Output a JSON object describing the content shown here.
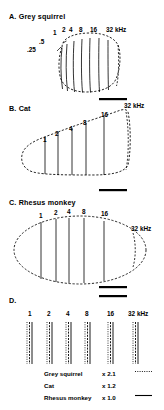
{
  "figure": {
    "caption_panels": [
      "A",
      "B",
      "C",
      "D"
    ],
    "unit": "kHz"
  },
  "panels": {
    "a": {
      "label": "A. Grey squirrel",
      "title_letter": "A.",
      "species": "Grey squirrel",
      "freq_labels": [
        ".25",
        ".5",
        "1",
        "2",
        "4",
        "8",
        "16"
      ],
      "top_label": "32 kHz",
      "shape": "rounded-oval",
      "isofrequency_contour_count": 8
    },
    "b": {
      "label": "B. Cat",
      "title_letter": "B.",
      "species": "Cat",
      "freq_labels": [
        "1",
        "2",
        "4",
        "8",
        "16"
      ],
      "top_label": "32 kHz",
      "shape": "wedge-teardrop",
      "isofrequency_contour_count": 6
    },
    "c": {
      "label": "C. Rhesus monkey",
      "title_letter": "C.",
      "species": "Rhesus monkey",
      "freq_labels": [
        "1",
        "2",
        "4",
        "8",
        "16"
      ],
      "top_label": "32 kHz",
      "shape": "ellipse",
      "isofrequency_contour_count": 6
    },
    "d": {
      "label": "D.",
      "title_letter": "D.",
      "freq_labels": [
        "1",
        "2",
        "4",
        "8",
        "16"
      ],
      "top_label": "32 kHz",
      "shape": "superimposed-contours"
    }
  },
  "legend": {
    "rows": [
      {
        "name": "Grey squirrel",
        "multiplier": "x 2.1",
        "line_style": "dotted"
      },
      {
        "name": "Cat",
        "multiplier": "x 1.2",
        "line_style": "dashed"
      },
      {
        "name": "Rhesus monkey",
        "multiplier": "x 1.0",
        "line_style": "solid"
      }
    ]
  },
  "scale_bars": {
    "count": 4,
    "note": "horizontal calibration bar"
  },
  "colors": {
    "ink": "#000000",
    "paper": "#ffffff"
  }
}
